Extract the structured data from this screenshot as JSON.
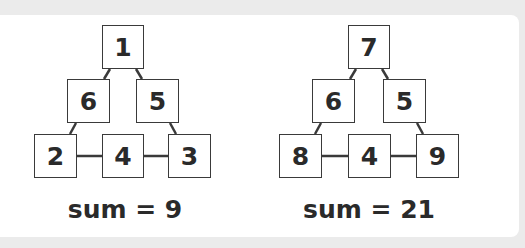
{
  "diagrams": [
    {
      "top": "1",
      "middle_left": "6",
      "middle_right": "5",
      "bottom_left": "2",
      "bottom_center": "4",
      "bottom_right": "3",
      "sum_label": "sum = 9"
    },
    {
      "top": "7",
      "middle_left": "6",
      "middle_right": "5",
      "bottom_left": "8",
      "bottom_center": "4",
      "bottom_right": "9",
      "sum_label": "sum = 21"
    }
  ],
  "colors": {
    "background": "#ebebeb",
    "panel": "#ffffff",
    "stroke": "#3a3a3a",
    "text": "#2a2a2a"
  }
}
